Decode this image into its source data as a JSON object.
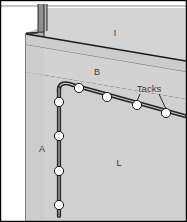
{
  "figure": {
    "canvas": {
      "width": 187,
      "height": 222
    },
    "colors": {
      "background": "#ffffff",
      "wall_light": "#d6d6d6",
      "wall_mid": "#cfcfcf",
      "wall_shadow": "#b8b8b8",
      "molding_face": "#d0d0d0",
      "molding_top": "#c2c2c2",
      "trim_dark": "#8a8a8a",
      "outline": "#1a1a1a",
      "cable": "#2b2b2b",
      "cable_highlight": "#9a9a9a",
      "tack_fill": "#ffffff",
      "tack_stroke": "#1a1a1a",
      "label_text": "#3a3a3a",
      "border": "#000000"
    },
    "labels": [
      {
        "id": "label-i",
        "text": "I",
        "x": 115,
        "y": 35,
        "note": "upper wall region"
      },
      {
        "id": "label-b",
        "text": "B",
        "x": 97,
        "y": 74,
        "note": "molding / baseboard band"
      },
      {
        "id": "label-a",
        "text": "A",
        "x": 42,
        "y": 150,
        "note": "vertical cable run"
      },
      {
        "id": "label-l",
        "text": "L",
        "x": 118,
        "y": 165,
        "note": "lower wall region"
      },
      {
        "id": "label-tacks",
        "text": "Tacks",
        "x": 141,
        "y": 92,
        "note": "callout for cable tacks"
      }
    ],
    "cable_runs": [
      {
        "id": "vertical-cable",
        "label": "A",
        "path": "M 59,86 L 59,215",
        "tack_count": 5
      },
      {
        "id": "diagonal-cable",
        "label": "B",
        "path": "M 59,86 C 59,80 66,83 72,86 L 184,116",
        "tack_count": 4
      }
    ],
    "tacks": [
      {
        "id": "tack-1",
        "x": 57,
        "y": 101
      },
      {
        "id": "tack-2",
        "x": 57,
        "y": 135
      },
      {
        "id": "tack-3",
        "x": 57,
        "y": 170
      },
      {
        "id": "tack-4",
        "x": 57,
        "y": 204
      },
      {
        "id": "tack-5",
        "x": 78,
        "y": 87
      },
      {
        "id": "tack-6",
        "x": 107,
        "y": 96
      },
      {
        "id": "tack-7",
        "x": 138,
        "y": 104
      },
      {
        "id": "tack-8",
        "x": 167,
        "y": 113
      }
    ],
    "leader_lines": [
      {
        "id": "leader-left",
        "from_x": 140,
        "from_y": 95,
        "to_x": 137,
        "to_y": 101
      },
      {
        "id": "leader-right",
        "from_x": 160,
        "from_y": 95,
        "to_x": 167,
        "to_y": 110
      }
    ]
  }
}
